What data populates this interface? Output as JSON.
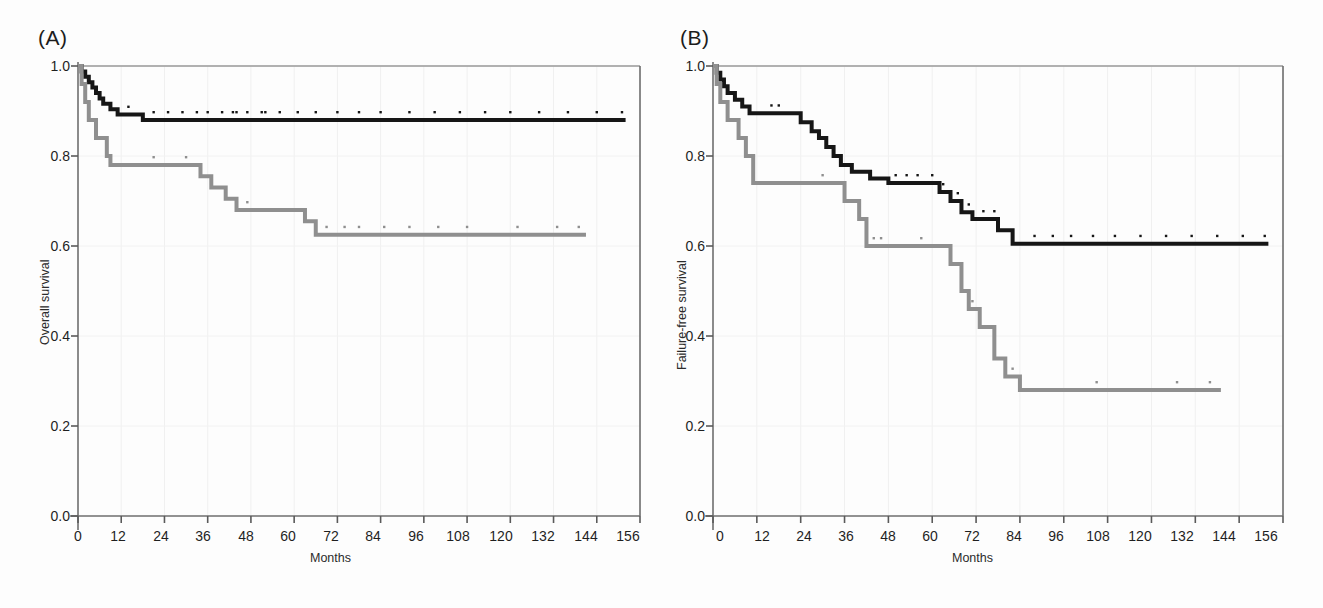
{
  "figure": {
    "background_color": "#fdfdfd",
    "panels": [
      {
        "id": "A",
        "label": "(A)",
        "xlabel": "Months",
        "ylabel": "Overall survival",
        "xticks": [
          "0",
          "12",
          "24",
          "36",
          "48",
          "60",
          "72",
          "84",
          "96",
          "108",
          "120",
          "132",
          "144",
          "156"
        ],
        "yticks": [
          "0.0",
          "0.2",
          "0.4",
          "0.6",
          "0.8",
          "1.0"
        ]
      },
      {
        "id": "B",
        "label": "(B)",
        "xlabel": "Months",
        "ylabel": "Failure-free survival",
        "xticks": [
          "0",
          "12",
          "24",
          "36",
          "48",
          "60",
          "72",
          "84",
          "96",
          "108",
          "120",
          "132",
          "144",
          "156"
        ],
        "yticks": [
          "0.0",
          "0.2",
          "0.4",
          "0.6",
          "0.8",
          "1.0"
        ]
      }
    ]
  },
  "chart_data": [
    {
      "type": "line",
      "subtype": "kaplan-meier-step",
      "panel": "A",
      "title": "(A)",
      "xlabel": "Months",
      "ylabel": "Overall survival",
      "xlim": [
        0,
        156
      ],
      "ylim": [
        0.0,
        1.0
      ],
      "xticks": [
        0,
        12,
        24,
        36,
        48,
        60,
        72,
        84,
        96,
        108,
        120,
        132,
        144,
        156
      ],
      "yticks": [
        0.0,
        0.2,
        0.4,
        0.6,
        0.8,
        1.0
      ],
      "grid": true,
      "legend": "none",
      "series": [
        {
          "name": "group-1",
          "color": "#161616",
          "line_width": 4,
          "points": [
            [
              0,
              1.0
            ],
            [
              1,
              0.988
            ],
            [
              2,
              0.976
            ],
            [
              3,
              0.964
            ],
            [
              4,
              0.952
            ],
            [
              5,
              0.94
            ],
            [
              6,
              0.928
            ],
            [
              7,
              0.916
            ],
            [
              9,
              0.904
            ],
            [
              11,
              0.892
            ],
            [
              18,
              0.88
            ],
            [
              152,
              0.88
            ]
          ],
          "censor_times": [
            14,
            21,
            25,
            29,
            33,
            36,
            40,
            43,
            44,
            47,
            51,
            52,
            56,
            61,
            66,
            72,
            78,
            84,
            92,
            99,
            106,
            113,
            120,
            128,
            136,
            144,
            151
          ]
        },
        {
          "name": "group-2",
          "color": "#8f8f8f",
          "line_width": 4,
          "points": [
            [
              0,
              1.0
            ],
            [
              1,
              0.96
            ],
            [
              2,
              0.92
            ],
            [
              3,
              0.88
            ],
            [
              5,
              0.84
            ],
            [
              8,
              0.8
            ],
            [
              9,
              0.78
            ],
            [
              34,
              0.755
            ],
            [
              37,
              0.73
            ],
            [
              41,
              0.705
            ],
            [
              44,
              0.68
            ],
            [
              63,
              0.655
            ],
            [
              66,
              0.625
            ],
            [
              141,
              0.625
            ]
          ],
          "censor_times": [
            21,
            30,
            41,
            47,
            69,
            74,
            78,
            85,
            92,
            100,
            108,
            122,
            133,
            139
          ]
        }
      ]
    },
    {
      "type": "line",
      "subtype": "kaplan-meier-step",
      "panel": "B",
      "title": "(B)",
      "xlabel": "Months",
      "ylabel": "Failure-free survival",
      "xlim": [
        0,
        156
      ],
      "ylim": [
        0.0,
        1.0
      ],
      "xticks": [
        0,
        12,
        24,
        36,
        48,
        60,
        72,
        84,
        96,
        108,
        120,
        132,
        144,
        156
      ],
      "yticks": [
        0.0,
        0.2,
        0.4,
        0.6,
        0.8,
        1.0
      ],
      "grid": true,
      "legend": "none",
      "series": [
        {
          "name": "group-1",
          "color": "#161616",
          "line_width": 4,
          "points": [
            [
              0,
              1.0
            ],
            [
              1,
              0.985
            ],
            [
              2,
              0.97
            ],
            [
              3,
              0.955
            ],
            [
              4,
              0.94
            ],
            [
              6,
              0.925
            ],
            [
              8,
              0.91
            ],
            [
              10,
              0.895
            ],
            [
              24,
              0.875
            ],
            [
              27,
              0.855
            ],
            [
              29,
              0.84
            ],
            [
              31,
              0.82
            ],
            [
              33,
              0.8
            ],
            [
              35,
              0.78
            ],
            [
              38,
              0.765
            ],
            [
              43,
              0.75
            ],
            [
              48,
              0.74
            ],
            [
              57,
              0.74
            ],
            [
              62,
              0.72
            ],
            [
              65,
              0.7
            ],
            [
              68,
              0.675
            ],
            [
              71,
              0.66
            ],
            [
              78,
              0.635
            ],
            [
              82,
              0.605
            ],
            [
              152,
              0.605
            ]
          ],
          "censor_times": [
            16,
            18,
            50,
            53,
            56,
            60,
            63,
            67,
            70,
            74,
            77,
            88,
            93,
            98,
            104,
            110,
            117,
            124,
            131,
            138,
            145,
            151
          ]
        },
        {
          "name": "group-2",
          "color": "#8f8f8f",
          "line_width": 4,
          "points": [
            [
              0,
              1.0
            ],
            [
              1,
              0.96
            ],
            [
              2,
              0.92
            ],
            [
              4,
              0.88
            ],
            [
              7,
              0.84
            ],
            [
              9,
              0.8
            ],
            [
              11,
              0.74
            ],
            [
              33,
              0.74
            ],
            [
              36,
              0.7
            ],
            [
              40,
              0.66
            ],
            [
              42,
              0.6
            ],
            [
              62,
              0.6
            ],
            [
              65,
              0.56
            ],
            [
              68,
              0.5
            ],
            [
              70,
              0.46
            ],
            [
              73,
              0.42
            ],
            [
              77,
              0.35
            ],
            [
              80,
              0.31
            ],
            [
              84,
              0.28
            ],
            [
              139,
              0.28
            ]
          ],
          "censor_times": [
            30,
            44,
            46,
            57,
            71,
            82,
            105,
            127,
            136
          ]
        }
      ]
    }
  ]
}
